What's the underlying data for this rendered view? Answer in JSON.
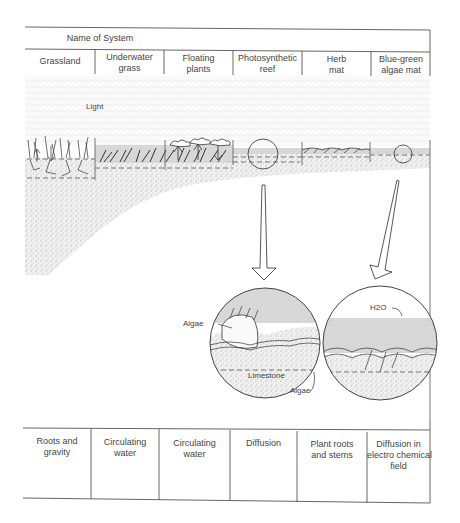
{
  "header": {
    "title": "Name of System",
    "systems": [
      {
        "name": "Grassland"
      },
      {
        "name": "Underwater\ngrass"
      },
      {
        "name": "Floating\nplants"
      },
      {
        "name": "Photosynthetic\nreef"
      },
      {
        "name": "Herb\nmat"
      },
      {
        "name": "Blue-green\nalgae mat"
      }
    ]
  },
  "diagram": {
    "light_label": "Light",
    "inset_left": {
      "labels": {
        "algae_top": "Algae",
        "limestone": "Limestone",
        "algae_bottom": "Algae"
      }
    },
    "inset_right": {
      "labels": {
        "water": "H2O"
      }
    }
  },
  "footer": {
    "mechanisms": [
      {
        "text": "Roots and\ngravity"
      },
      {
        "text": "Circulating\nwater"
      },
      {
        "text": "Circulating\nwater"
      },
      {
        "text": "Diffusion"
      },
      {
        "text": "Plant roots\nand stems"
      },
      {
        "text": "Diffusion in\nelectro chemical\nfield"
      }
    ]
  },
  "colors": {
    "line": "#555555",
    "stipple": "#bdbdbd",
    "water": "#d4d4d4",
    "text": "#444444"
  }
}
